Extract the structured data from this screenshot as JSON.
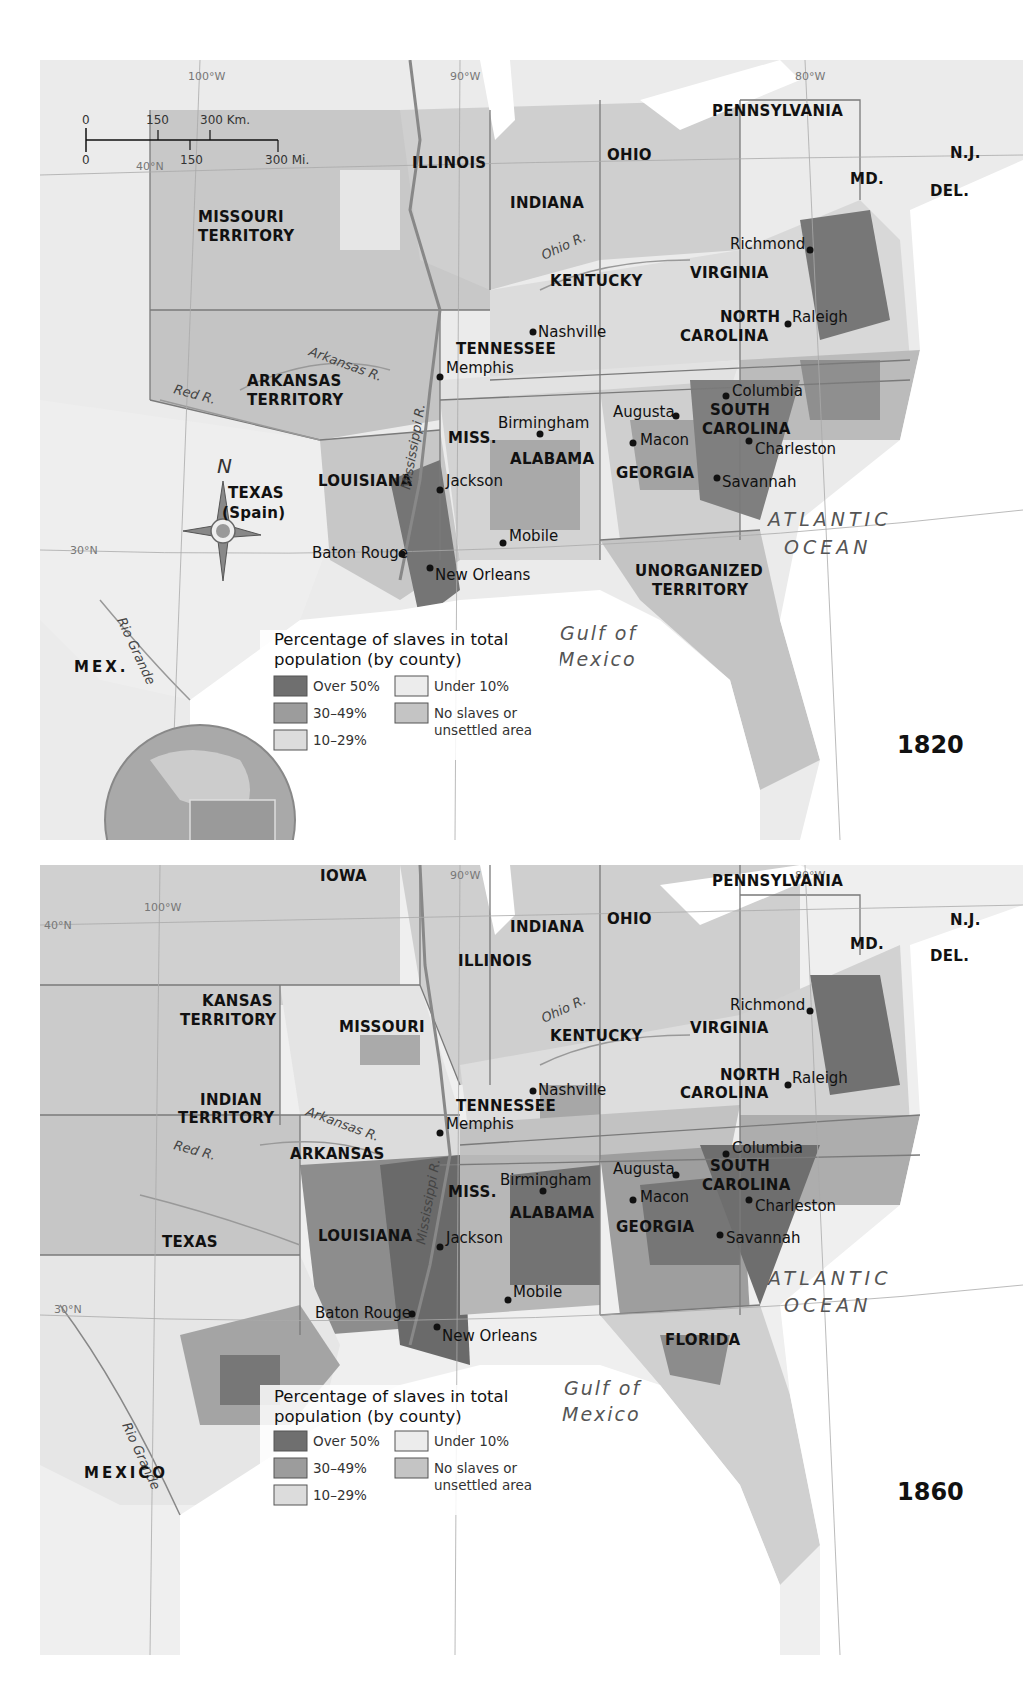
{
  "colors": {
    "over_50": "#6f6f6f",
    "p30_49": "#9c9c9c",
    "p10_29": "#d6d6d6",
    "under_10": "#e9e9e9",
    "no_slaves": "#c4c4c4",
    "land_foreign": "#ececec",
    "water": "#ffffff",
    "border": "#7a7a7a"
  },
  "scale_bar": {
    "km_ticks": [
      "0",
      "150",
      "300 Km."
    ],
    "mi_ticks": [
      "0",
      "150",
      "300 Mi."
    ]
  },
  "compass": {
    "north_label": "N"
  },
  "legend": {
    "title_line1": "Percentage of slaves in total",
    "title_line2": "population (by county)",
    "items": [
      {
        "label": "Over 50%",
        "color_key": "over_50"
      },
      {
        "label": "30–49%",
        "color_key": "p30_49"
      },
      {
        "label": "10–29%",
        "color_key": "p10_29"
      },
      {
        "label": "Under 10%",
        "color_key": "under_10"
      },
      {
        "label_line1": "No slaves or",
        "label_line2": "unsettled area",
        "color_key": "no_slaves"
      }
    ]
  },
  "maps": [
    {
      "year": "1820",
      "gridlines": {
        "lon_100": "100°W",
        "lon_90": "90°W",
        "lon_80": "80°W",
        "lat_40": "40°N",
        "lat_30": "30°N"
      },
      "states": {
        "pennsylvania": "PENNSYLVANIA",
        "nj": "N.J.",
        "md": "MD.",
        "del": "DEL.",
        "illinois": "ILLINOIS",
        "indiana": "INDIANA",
        "ohio": "OHIO",
        "missouri_t1": "MISSOURI",
        "missouri_t2": "TERRITORY",
        "kentucky": "KENTUCKY",
        "virginia": "VIRGINIA",
        "nc1": "NORTH",
        "nc2": "CAROLINA",
        "tennessee": "TENNESSEE",
        "arkansas_t1": "ARKANSAS",
        "arkansas_t2": "TERRITORY",
        "miss": "MISS.",
        "alabama": "ALABAMA",
        "georgia": "GEORGIA",
        "sc1": "SOUTH",
        "sc2": "CAROLINA",
        "louisiana": "LOUISIANA",
        "texas1": "TEXAS",
        "texas2": "(Spain)",
        "unorg1": "UNORGANIZED",
        "unorg2": "TERRITORY"
      },
      "cities": [
        "Richmond",
        "Raleigh",
        "Nashville",
        "Memphis",
        "Columbia",
        "Augusta",
        "Macon",
        "Charleston",
        "Savannah",
        "Birmingham",
        "Jackson",
        "Mobile",
        "Baton Rouge",
        "New Orleans"
      ],
      "rivers": {
        "ohio": "Ohio R.",
        "arkansas": "Arkansas R.",
        "red": "Red R.",
        "mississippi": "Mississippi R.",
        "rio_grande": "Rio Grande"
      },
      "water": {
        "atlantic1": "ATLANTIC",
        "atlantic2": "OCEAN",
        "gulf1": "Gulf of",
        "gulf2": "Mexico"
      },
      "country": "MEX."
    },
    {
      "year": "1860",
      "gridlines": {
        "lon_100": "100°W",
        "lon_90": "90°W",
        "lon_80": "80°W",
        "lat_40": "40°N",
        "lat_30": "30°N"
      },
      "states": {
        "pennsylvania": "PENNSYLVANIA",
        "nj": "N.J.",
        "md": "MD.",
        "del": "DEL.",
        "iowa": "IOWA",
        "illinois": "ILLINOIS",
        "indiana": "INDIANA",
        "ohio": "OHIO",
        "kansas1": "KANSAS",
        "kansas2": "TERRITORY",
        "missouri": "MISSOURI",
        "kentucky": "KENTUCKY",
        "virginia": "VIRGINIA",
        "nc1": "NORTH",
        "nc2": "CAROLINA",
        "indian1": "INDIAN",
        "indian2": "TERRITORY",
        "tennessee": "TENNESSEE",
        "arkansas": "ARKANSAS",
        "miss": "MISS.",
        "alabama": "ALABAMA",
        "georgia": "GEORGIA",
        "sc1": "SOUTH",
        "sc2": "CAROLINA",
        "louisiana": "LOUISIANA",
        "texas": "TEXAS",
        "florida": "FLORIDA"
      },
      "cities": [
        "Richmond",
        "Raleigh",
        "Nashville",
        "Memphis",
        "Columbia",
        "Augusta",
        "Macon",
        "Charleston",
        "Savannah",
        "Birmingham",
        "Jackson",
        "Mobile",
        "Baton Rouge",
        "New Orleans"
      ],
      "rivers": {
        "ohio": "Ohio R.",
        "arkansas": "Arkansas R.",
        "red": "Red R.",
        "mississippi": "Mississippi R.",
        "rio_grande": "Rio Grande"
      },
      "water": {
        "atlantic1": "ATLANTIC",
        "atlantic2": "OCEAN",
        "gulf1": "Gulf of",
        "gulf2": "Mexico"
      },
      "country": "MEXICO"
    }
  ]
}
